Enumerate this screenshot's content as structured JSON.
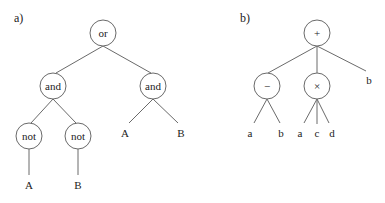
{
  "panels": [
    {
      "label": "a)",
      "nodes": {
        "root": "or",
        "and_left": "and",
        "and_right": "and",
        "not_left": "not",
        "not_right": "not",
        "leaf_not_left": "A",
        "leaf_not_right": "B",
        "leaf_and_right_1": "A",
        "leaf_and_right_2": "B"
      }
    },
    {
      "label": "b)",
      "nodes": {
        "root": "+",
        "minus": "−",
        "times": "×",
        "leaf_root_b": "b",
        "leaf_minus_a": "a",
        "leaf_minus_b": "b",
        "leaf_times_a": "a",
        "leaf_times_c": "c",
        "leaf_times_d": "d"
      }
    }
  ]
}
